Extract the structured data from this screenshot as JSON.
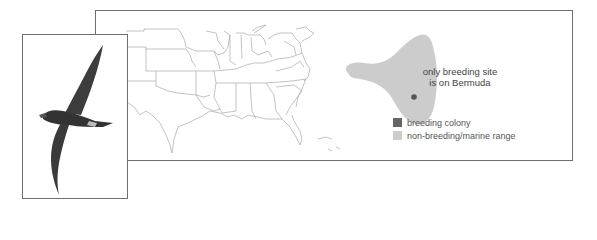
{
  "figure": {
    "annotation": {
      "line1": "only breeding site",
      "line2": "is on Bermuda"
    },
    "legend": [
      {
        "label": "breeding colony",
        "color": "#666666"
      },
      {
        "label": "non-breeding/marine range",
        "color": "#cccccc"
      }
    ],
    "map": {
      "region": "Eastern United States and western North Atlantic",
      "range_color": "#cccccc",
      "colony_color": "#555555"
    },
    "illustration": {
      "subject": "seabird in flight (petrel)",
      "bird_color": "#3d3d3d"
    }
  }
}
